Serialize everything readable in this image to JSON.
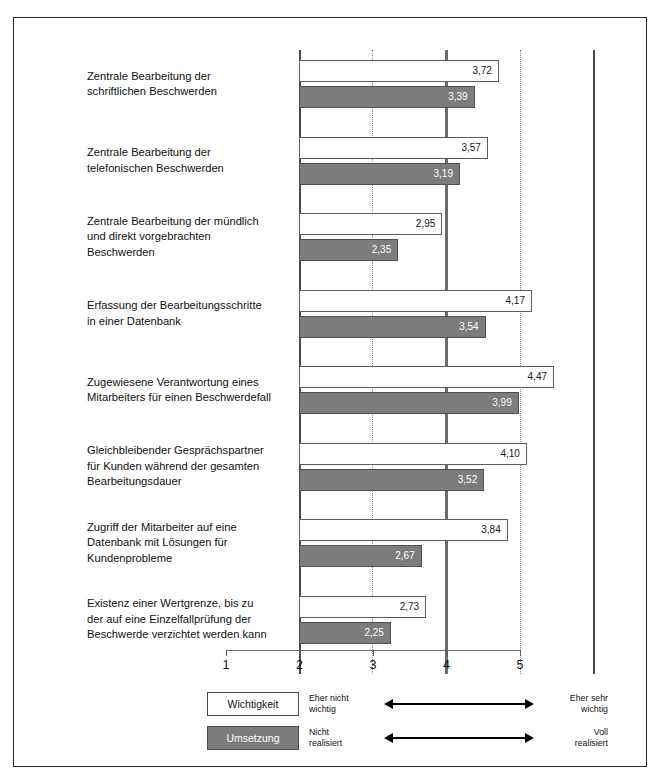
{
  "chart_data": {
    "type": "bar",
    "orientation": "horizontal",
    "title": "",
    "xlabel": "",
    "ylabel": "",
    "xlim": [
      1,
      5
    ],
    "xticks": [
      "1",
      "2",
      "3",
      "4",
      "5"
    ],
    "grid": "vertical dotted gridlines at 2 and 4, thick solid line at 3",
    "legend_position": "bottom",
    "categories": [
      "Zentrale Bearbeitung der schriftlichen Beschwerden",
      "Zentrale Bearbeitung der telefonischen Beschwerden",
      "Zentrale Bearbeitung der mündlich und direkt vorgebrachten Beschwerden",
      "Erfassung der Bearbeitungsschritte in einer Datenbank",
      "Zugewiesene Verantwortung eines Mitarbeiters für einen Beschwerdefall",
      "Gleichbleibender Gesprächspartner für Kunden während der gesamten Bearbeitungsdauer",
      "Zugriff der Mitarbeiter auf eine Datenbank mit Lösungen für Kundenprobleme",
      "Existenz einer Wertgrenze, bis zu der auf eine Einzelfallprüfung der Beschwerde verzichtet werden kann"
    ],
    "series": [
      {
        "name": "Wichtigkeit",
        "color": "#ffffff",
        "values": [
          3.72,
          3.57,
          2.95,
          4.17,
          4.47,
          4.1,
          3.84,
          2.73
        ],
        "labels": [
          "3,72",
          "3,57",
          "2,95",
          "4,17",
          "4,47",
          "4,10",
          "3,84",
          "2,73"
        ]
      },
      {
        "name": "Umsetzung",
        "color": "#7c7c7c",
        "values": [
          3.39,
          3.19,
          2.35,
          3.54,
          3.99,
          3.52,
          2.67,
          2.25
        ],
        "labels": [
          "3,39",
          "3,19",
          "2,35",
          "3,54",
          "3,99",
          "3,52",
          "2,67",
          "2,25"
        ]
      }
    ]
  },
  "category_lines": [
    [
      "Zentrale Bearbeitung der",
      "schriftlichen Beschwerden"
    ],
    [
      "Zentrale Bearbeitung der",
      "telefonischen Beschwerden"
    ],
    [
      "Zentrale Bearbeitung der mündlich",
      "und direkt vorgebrachten",
      "Beschwerden"
    ],
    [
      "Erfassung der Bearbeitungsschritte",
      "in einer Datenbank"
    ],
    [
      "Zugewiesene Verantwortung eines",
      "Mitarbeiters für einen Beschwerdefall"
    ],
    [
      "Gleichbleibender Gesprächspartner",
      "für Kunden während der gesamten",
      "Bearbeitungsdauer"
    ],
    [
      "Zugriff der Mitarbeiter auf eine",
      "Datenbank mit Lösungen für",
      "Kundenprobleme"
    ],
    [
      "Existenz einer Wertgrenze, bis zu",
      "der auf eine Einzelfallprüfung der",
      "Beschwerde verzichtet werden kann"
    ]
  ],
  "legend": {
    "rows": [
      {
        "swatch_label": "Wichtigkeit",
        "left_line1": "Eher nicht",
        "left_line2": "wichtig",
        "right_line1": "Eher sehr",
        "right_line2": "wichtig"
      },
      {
        "swatch_label": "Umsetzung",
        "left_line1": "Nicht",
        "left_line2": "realisiert",
        "right_line1": "Voll",
        "right_line2": "realisiert"
      }
    ]
  }
}
